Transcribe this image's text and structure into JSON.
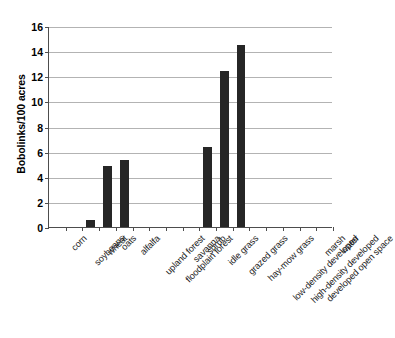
{
  "chart_data": {
    "type": "bar",
    "title": "",
    "xlabel": "",
    "ylabel": "Bobolinks/100 acres",
    "ylim": [
      0,
      16
    ],
    "ytick_step": 2,
    "yticks": [
      "16",
      "14",
      "12",
      "10",
      "8",
      "6",
      "4",
      "2",
      "0"
    ],
    "grid": "horizontal",
    "legend": "none",
    "bar_color": "#262626",
    "gridline_color": "#b3b3b3",
    "axis_color": "#4d4d4d",
    "categories": [
      "corn",
      "soybeans",
      "wheat",
      "oats",
      "alfalfa",
      "upland forest",
      "floodplain forest",
      "savanna",
      "shrub",
      "idle grass",
      "grazed grass",
      "hay-mow grass",
      "low-density developed",
      "high-density developed",
      "developed open space",
      "marsh",
      "water"
    ],
    "values": [
      0,
      0,
      0.55,
      4.85,
      5.35,
      0,
      0,
      0,
      0,
      6.4,
      12.4,
      14.5,
      0,
      0,
      0,
      0,
      0
    ]
  }
}
